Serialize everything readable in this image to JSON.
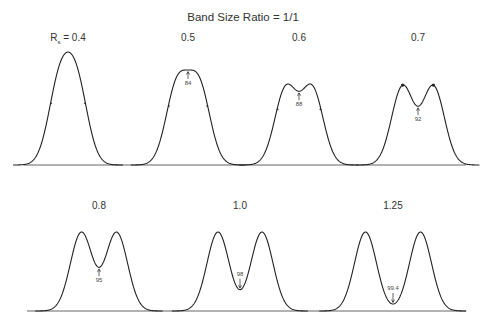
{
  "chart_data": {
    "type": "line",
    "title": "Band Size Ratio = 1/1",
    "xlabel": "",
    "ylabel": "",
    "grid": false,
    "legend": null,
    "panels": [
      {
        "label": "Rs = 0.4",
        "rs": 0.4,
        "valley_label": "",
        "markers": "inflection-dots"
      },
      {
        "label": "0.5",
        "rs": 0.5,
        "valley_label": "84",
        "markers": "inflection-dots"
      },
      {
        "label": "0.6",
        "rs": 0.6,
        "valley_label": "88",
        "markers": "inflection-dots"
      },
      {
        "label": "0.7",
        "rs": 0.7,
        "valley_label": "92",
        "markers": "peak-dots"
      },
      {
        "label": "0.8",
        "rs": 0.8,
        "valley_label": "95",
        "markers": "none"
      },
      {
        "label": "1.0",
        "rs": 1.0,
        "valley_label": "98",
        "markers": "none"
      },
      {
        "label": "1.25",
        "rs": 1.25,
        "valley_label": "99.4",
        "markers": "none"
      }
    ]
  },
  "figure": {
    "title": "Band Size Ratio = 1/1",
    "rows": [
      {
        "baseline_y": 165,
        "x_start": 24,
        "x_end": 466,
        "panels": [
          {
            "label_prefix": "R",
            "label_sub": "s",
            "label_value": " = 0.4",
            "cx": 68,
            "label_y": 38,
            "rs": 0.4,
            "peak_y": 52,
            "valley_label": "",
            "label_side": "none",
            "marker": "inflection"
          },
          {
            "label_prefix": "",
            "label_sub": "",
            "label_value": "0.5",
            "cx": 188,
            "label_y": 38,
            "rs": 0.5,
            "peak_y": 70,
            "valley_label": "84",
            "label_side": "below-up",
            "marker": "inflection"
          },
          {
            "label_prefix": "",
            "label_sub": "",
            "label_value": "0.6",
            "cx": 299,
            "label_y": 38,
            "rs": 0.6,
            "peak_y": 84,
            "valley_label": "88",
            "label_side": "below-up",
            "marker": "inflection"
          },
          {
            "label_prefix": "",
            "label_sub": "",
            "label_value": "0.7",
            "cx": 418,
            "label_y": 38,
            "rs": 0.7,
            "peak_y": 85,
            "valley_label": "92",
            "label_side": "below-up",
            "marker": "peak"
          }
        ]
      },
      {
        "baseline_y": 311,
        "x_start": 27,
        "x_end": 466,
        "panels": [
          {
            "label_prefix": "",
            "label_sub": "",
            "label_value": "0.8",
            "cx": 99,
            "label_y": 206,
            "rs": 0.8,
            "peak_y": 232,
            "valley_label": "95",
            "label_side": "below-up",
            "marker": "none"
          },
          {
            "label_prefix": "",
            "label_sub": "",
            "label_value": "1.0",
            "cx": 240,
            "label_y": 206,
            "rs": 1.0,
            "peak_y": 232,
            "valley_label": "98",
            "label_side": "above-down",
            "marker": "none"
          },
          {
            "label_prefix": "",
            "label_sub": "",
            "label_value": "1.25",
            "cx": 393,
            "label_y": 206,
            "rs": 1.25,
            "peak_y": 232,
            "valley_label": "99.4",
            "label_side": "above-down",
            "marker": "none"
          }
        ]
      }
    ],
    "colors": {
      "curve": "#222222",
      "baseline": "#555555",
      "text": "#333333"
    }
  }
}
